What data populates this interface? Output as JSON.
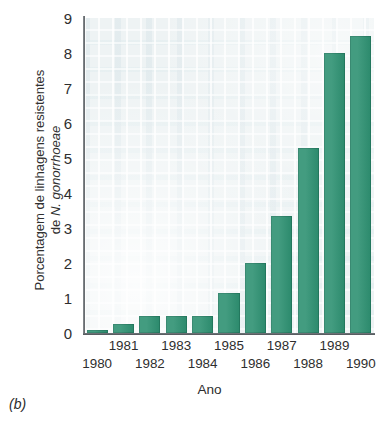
{
  "chart_data": {
    "type": "bar",
    "title": "",
    "xlabel": "Ano",
    "ylabel_line1": "Porcentagem de linhagens resistentes",
    "ylabel_line2_prefix": "de ",
    "ylabel_line2_italic": "N. gonorrhoeae",
    "categories": [
      "1980",
      "1981",
      "1982",
      "1983",
      "1984",
      "1985",
      "1986",
      "1987",
      "1988",
      "1989",
      "1990"
    ],
    "values": [
      0.1,
      0.25,
      0.5,
      0.5,
      0.5,
      1.15,
      2.0,
      3.35,
      5.3,
      8.0,
      8.5
    ],
    "ylim": [
      0,
      9
    ],
    "yticks": [
      0,
      1,
      2,
      3,
      4,
      5,
      6,
      7,
      8,
      9
    ],
    "ytick_labels": [
      "0",
      "1",
      "2",
      "3",
      "4",
      "5",
      "6",
      "7",
      "8",
      "9"
    ],
    "grid": false,
    "legend": "none",
    "bar_color": "#2e9172",
    "plot_background": "#eef3f4",
    "axis_color": "#5c6165"
  },
  "figure": {
    "panel_caption": "(b)"
  }
}
